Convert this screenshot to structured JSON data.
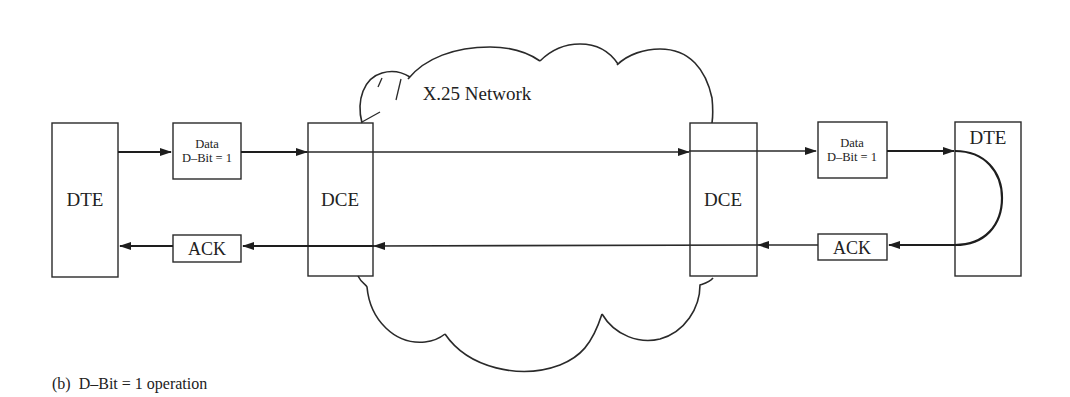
{
  "diagram": {
    "network_label": "X.25 Network",
    "left": {
      "dte_label": "DTE",
      "data_box": {
        "line1": "Data",
        "line2": "D–Bit = 1"
      },
      "ack_label": "ACK",
      "dce_label": "DCE"
    },
    "right": {
      "dce_label": "DCE",
      "data_box": {
        "line1": "Data",
        "line2": "D–Bit = 1"
      },
      "ack_label": "ACK",
      "dte_label": "DTE"
    },
    "flows": [
      {
        "name": "data-flow",
        "direction": "left-to-right",
        "path": [
          "DTE",
          "Data D-Bit = 1",
          "DCE",
          "X.25 Network",
          "DCE",
          "Data D-Bit = 1",
          "DTE"
        ]
      },
      {
        "name": "ack-flow",
        "direction": "right-to-left",
        "path": [
          "DTE",
          "ACK",
          "DCE",
          "X.25 Network",
          "DCE",
          "ACK",
          "DTE"
        ]
      }
    ],
    "caption": "(b)  D–Bit = 1 operation"
  }
}
